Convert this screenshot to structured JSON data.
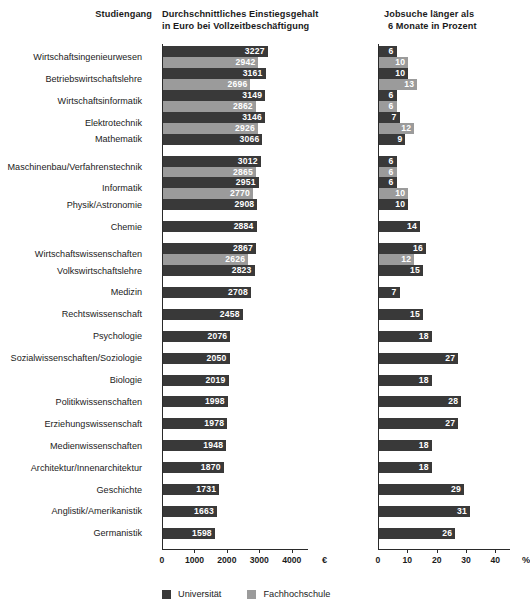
{
  "headers": {
    "category": "Studiengang",
    "salary_line1": "Durchschnittliches Einstiegsgehalt",
    "salary_line2": "in Euro bei Vollzeitbeschäftigung",
    "pct_line1": "Jobsuche länger als",
    "pct_line2": "6 Monate in Prozent"
  },
  "legend": {
    "uni_label": "Universität",
    "fh_label": "Fachhochschule",
    "uni_color": "#393939",
    "fh_color": "#9b9b9b"
  },
  "axes": {
    "salary": {
      "ticks": [
        "0",
        "1000",
        "2000",
        "3000",
        "4000"
      ],
      "tick_values": [
        0,
        1000,
        2000,
        3000,
        4000
      ],
      "unit": "€",
      "min": 0,
      "max": 4500
    },
    "pct": {
      "ticks": [
        "0",
        "10",
        "20",
        "30",
        "40"
      ],
      "tick_values": [
        0,
        10,
        20,
        30,
        40
      ],
      "unit": "%",
      "min": 0,
      "max": 45
    }
  },
  "chart_data": {
    "type": "bar",
    "orientation": "horizontal",
    "grid": false,
    "legend_position": "bottom-left",
    "categories": [
      "Wirtschaftsingenieurwesen",
      "Betriebswirtschaftslehre",
      "Wirtschaftsinformatik",
      "Elektrotechnik",
      "Mathematik",
      "Maschinenbau/Verfahrenstechnik",
      "Informatik",
      "Physik/Astronomie",
      "Chemie",
      "Wirtschaftswissenschaften",
      "Volkswirtschaftslehre",
      "Medizin",
      "Rechtswissenschaft",
      "Psychologie",
      "Sozialwissenschaften/Soziologie",
      "Biologie",
      "Politikwissenschaften",
      "Erziehungswissenschaft",
      "Medienwissenschaften",
      "Architektur/Innenarchitektur",
      "Geschichte",
      "Anglistik/Amerikanistik",
      "Germanistik"
    ],
    "panels": [
      {
        "name": "salary",
        "xlabel": "€",
        "ylabel": "",
        "xlim": [
          0,
          4500
        ],
        "series": [
          {
            "name": "Universität",
            "color": "#393939",
            "values": [
              3227,
              3161,
              3149,
              3146,
              3066,
              3012,
              2951,
              2908,
              2884,
              2867,
              2823,
              2708,
              2458,
              2076,
              2050,
              2019,
              1998,
              1978,
              1948,
              1870,
              1731,
              1663,
              1598
            ]
          },
          {
            "name": "Fachhochschule",
            "color": "#9b9b9b",
            "values": [
              2942,
              2696,
              2862,
              2926,
              null,
              2865,
              2770,
              null,
              null,
              2626,
              null,
              null,
              null,
              null,
              null,
              null,
              null,
              null,
              null,
              null,
              null,
              null,
              null
            ]
          }
        ]
      },
      {
        "name": "pct",
        "xlabel": "%",
        "ylabel": "",
        "xlim": [
          0,
          45
        ],
        "series": [
          {
            "name": "Universität",
            "color": "#393939",
            "values": [
              6,
              10,
              6,
              7,
              9,
              6,
              6,
              10,
              14,
              16,
              15,
              7,
              15,
              18,
              27,
              18,
              28,
              27,
              18,
              18,
              29,
              31,
              26
            ]
          },
          {
            "name": "Fachhochschule",
            "color": "#9b9b9b",
            "values": [
              10,
              13,
              6,
              12,
              null,
              6,
              10,
              null,
              null,
              12,
              null,
              null,
              null,
              null,
              null,
              null,
              null,
              null,
              null,
              null,
              null,
              null,
              null
            ]
          }
        ]
      }
    ]
  }
}
